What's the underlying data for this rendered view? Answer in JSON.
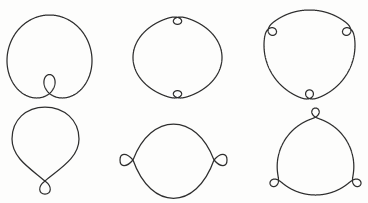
{
  "canvas": {
    "width": 368,
    "height": 203,
    "background": "#fdfdfc",
    "stroke": "#2e2e2e"
  },
  "figures": [
    {
      "id": "circle-one-inner-loop",
      "row": 1,
      "col": 1,
      "description": "closed curve with one inner loop at bottom",
      "type": "limacon",
      "params": {
        "a": 51.5,
        "b": 31.5,
        "loop_direction_deg": -90
      },
      "box": {
        "x0": 7,
        "y0": 15,
        "x1": 92,
        "y1": 98
      }
    },
    {
      "id": "circle-two-inner-loops",
      "row": 1,
      "col": 2,
      "description": "closed curve with two inner loops at top and bottom",
      "type": "turning",
      "params": {
        "n": 2,
        "sigma": 1,
        "w": 0.075,
        "loop_angle_deg": -90
      },
      "box": {
        "x0": 133,
        "y0": 17,
        "x1": 222,
        "y1": 98
      }
    },
    {
      "id": "circle-three-inner-loops",
      "row": 1,
      "col": 3,
      "description": "closed curve with three inner loops",
      "type": "turning",
      "params": {
        "n": 3,
        "sigma": 1,
        "w": 0.07,
        "loop_angle_deg": 90
      },
      "box": {
        "x0": 264,
        "y0": 10,
        "x1": 355,
        "y1": 99
      }
    },
    {
      "id": "teardrop-one-outer-loop",
      "row": 2,
      "col": 1,
      "description": "teardrop curve with one outer loop at bottom",
      "type": "path",
      "d": "M 45,181 C 59,169 79,158 79,139 C 79,120 64,107 45,107 C 26,107 12,120 12,139 C 12,158 31,169 45,181 C 53,187 51,194 45,194 C 39,194 37,187 45,181 Z"
    },
    {
      "id": "lens-two-outer-loops",
      "row": 2,
      "col": 2,
      "description": "lens curve with two outer loops at left and right",
      "type": "path",
      "d": "M 133,160 C 151,112 196,112 214,160 C 221,168 227,167 227,160 C 227,153 221,152 214,160 C 196,211 151,211 133,160 C 126,152 120,153 120,160 C 120,167 126,168 133,160 Z"
    },
    {
      "id": "circle-three-outer-loops",
      "row": 2,
      "col": 3,
      "description": "closed curve with three outer loops",
      "type": "turning",
      "params": {
        "n": 3,
        "sigma": -1,
        "w": 0.065,
        "loop_angle_deg": -90
      },
      "box": {
        "x0": 270,
        "y0": 108,
        "x1": 361,
        "y1": 195
      }
    }
  ]
}
